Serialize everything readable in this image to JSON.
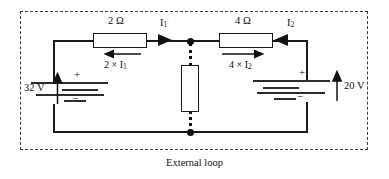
{
  "figure": {
    "caption": "External loop",
    "boundary_style": "dashed"
  },
  "components": {
    "resistor_left": {
      "value_label": "2 Ω",
      "drop_label_prefix": "2 × I",
      "drop_label_sub": "1",
      "drop_arrow_direction": "left"
    },
    "resistor_right": {
      "value_label": "4 Ω",
      "drop_label_prefix": "4 × I",
      "drop_label_sub": "2",
      "drop_arrow_direction": "right"
    },
    "resistor_middle": {
      "value_label": "",
      "branch_style": "dotted"
    },
    "battery_left": {
      "value_label": "32 V",
      "plus_sign": "+",
      "minus_sign": "−",
      "arrow_direction": "up"
    },
    "battery_right": {
      "value_label": "20 V",
      "plus_sign": "+",
      "minus_sign": "−",
      "arrow_direction": "up"
    }
  },
  "currents": {
    "left": {
      "symbol": "I",
      "subscript": "1",
      "arrow_direction": "right"
    },
    "right": {
      "symbol": "I",
      "subscript": "2",
      "arrow_direction": "left"
    }
  },
  "colors": {
    "wire": "#1a1a1a",
    "boundary": "#3a3a3a",
    "text": "#111111",
    "background": "#ffffff"
  }
}
